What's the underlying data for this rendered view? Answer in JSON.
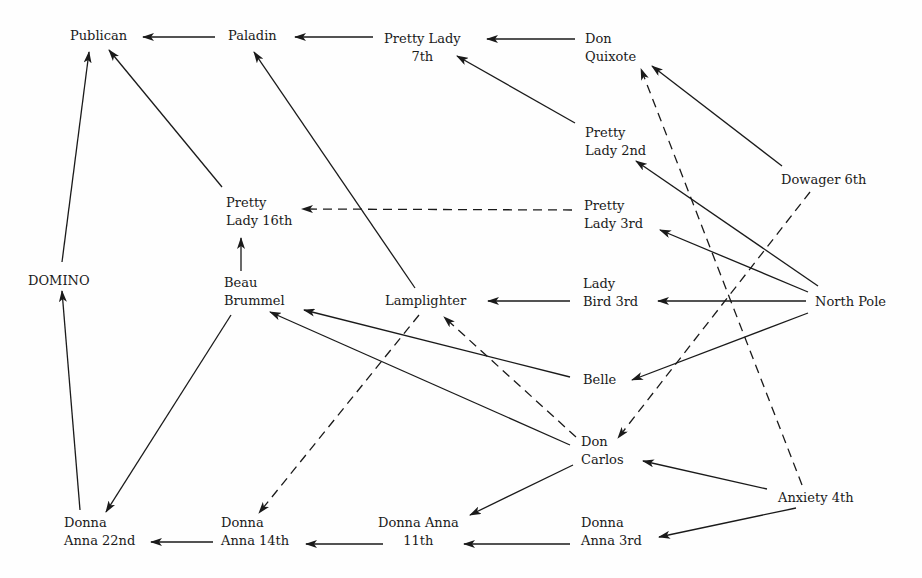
{
  "diagram": {
    "title": "",
    "nodes": [
      {
        "id": "publican",
        "label": "Publican",
        "x": 70,
        "y": 27,
        "align": "left"
      },
      {
        "id": "paladin",
        "label": "Paladin",
        "x": 228,
        "y": 27,
        "align": "left"
      },
      {
        "id": "pretty_lady_7th",
        "label": "Pretty Lady\n7th",
        "x": 384,
        "y": 30,
        "align": "center"
      },
      {
        "id": "don_quixote",
        "label": "Don\nQuixote",
        "x": 585,
        "y": 30,
        "align": "left"
      },
      {
        "id": "pretty_lady_2nd",
        "label": "Pretty\nLady 2nd",
        "x": 585,
        "y": 124,
        "align": "left"
      },
      {
        "id": "dowager_6th",
        "label": "Dowager 6th",
        "x": 781,
        "y": 171,
        "align": "left"
      },
      {
        "id": "pretty_lady_16th",
        "label": "Pretty\nLady 16th",
        "x": 226,
        "y": 194,
        "align": "left"
      },
      {
        "id": "pretty_lady_3rd",
        "label": "Pretty\nLady 3rd",
        "x": 584,
        "y": 197,
        "align": "left"
      },
      {
        "id": "domino",
        "label": "DOMINO",
        "x": 28,
        "y": 272,
        "align": "left"
      },
      {
        "id": "beau_brummel",
        "label": "Beau\nBrummel",
        "x": 224,
        "y": 274,
        "align": "left"
      },
      {
        "id": "lamplighter",
        "label": "Lamplighter",
        "x": 385,
        "y": 292,
        "align": "left"
      },
      {
        "id": "lady_bird_3rd",
        "label": "Lady\nBird 3rd",
        "x": 583,
        "y": 275,
        "align": "left"
      },
      {
        "id": "north_pole",
        "label": "North Pole",
        "x": 815,
        "y": 293,
        "align": "left"
      },
      {
        "id": "belle",
        "label": "Belle",
        "x": 583,
        "y": 371,
        "align": "left"
      },
      {
        "id": "don_carlos",
        "label": "Don\nCarlos",
        "x": 581,
        "y": 433,
        "align": "left"
      },
      {
        "id": "anxiety_4th",
        "label": "Anxiety 4th",
        "x": 778,
        "y": 489,
        "align": "left"
      },
      {
        "id": "donna_anna_22nd",
        "label": "Donna\nAnna 22nd",
        "x": 64,
        "y": 514,
        "align": "left"
      },
      {
        "id": "donna_anna_14th",
        "label": "Donna\nAnna 14th",
        "x": 221,
        "y": 514,
        "align": "left"
      },
      {
        "id": "donna_anna_11th",
        "label": "Donna Anna\n11th",
        "x": 378,
        "y": 514,
        "align": "center"
      },
      {
        "id": "donna_anna_3rd",
        "label": "Donna\nAnna 3rd",
        "x": 581,
        "y": 514,
        "align": "left"
      }
    ],
    "edges": [
      {
        "from": "paladin",
        "to": "publican",
        "style": "solid",
        "x1": 215,
        "y1": 37,
        "x2": 143,
        "y2": 37
      },
      {
        "from": "pretty_lady_7th",
        "to": "paladin",
        "style": "solid",
        "x1": 373,
        "y1": 37,
        "x2": 295,
        "y2": 37
      },
      {
        "from": "don_quixote",
        "to": "pretty_lady_7th",
        "style": "solid",
        "x1": 575,
        "y1": 39,
        "x2": 487,
        "y2": 39
      },
      {
        "from": "pretty_lady_2nd",
        "to": "pretty_lady_7th",
        "style": "solid",
        "x1": 575,
        "y1": 123,
        "x2": 457,
        "y2": 56
      },
      {
        "from": "dowager_6th",
        "to": "don_quixote",
        "style": "solid",
        "x1": 782,
        "y1": 166,
        "x2": 652,
        "y2": 66
      },
      {
        "from": "domino",
        "to": "publican",
        "style": "solid",
        "x1": 62,
        "y1": 262,
        "x2": 89,
        "y2": 52
      },
      {
        "from": "pretty_lady_16th",
        "to": "publican",
        "style": "solid",
        "x1": 222,
        "y1": 187,
        "x2": 109,
        "y2": 50
      },
      {
        "from": "lamplighter",
        "to": "paladin",
        "style": "solid",
        "x1": 415,
        "y1": 288,
        "x2": 254,
        "y2": 52
      },
      {
        "from": "beau_brummel",
        "to": "pretty_lady_16th",
        "style": "solid",
        "x1": 241,
        "y1": 271,
        "x2": 241,
        "y2": 238
      },
      {
        "from": "pretty_lady_3rd",
        "to": "pretty_lady_16th",
        "style": "dashed",
        "x1": 572,
        "y1": 210,
        "x2": 302,
        "y2": 209
      },
      {
        "from": "north_pole",
        "to": "pretty_lady_2nd",
        "style": "solid",
        "x1": 818,
        "y1": 286,
        "x2": 636,
        "y2": 161
      },
      {
        "from": "north_pole",
        "to": "pretty_lady_3rd",
        "style": "solid",
        "x1": 808,
        "y1": 292,
        "x2": 660,
        "y2": 230
      },
      {
        "from": "north_pole",
        "to": "lady_bird_3rd",
        "style": "solid",
        "x1": 806,
        "y1": 301,
        "x2": 658,
        "y2": 301
      },
      {
        "from": "north_pole",
        "to": "belle",
        "style": "solid",
        "x1": 808,
        "y1": 313,
        "x2": 632,
        "y2": 380
      },
      {
        "from": "lady_bird_3rd",
        "to": "lamplighter",
        "style": "solid",
        "x1": 570,
        "y1": 301,
        "x2": 488,
        "y2": 301
      },
      {
        "from": "belle",
        "to": "beau_brummel",
        "style": "solid",
        "x1": 570,
        "y1": 377,
        "x2": 304,
        "y2": 310
      },
      {
        "from": "don_carlos",
        "to": "beau_brummel",
        "style": "solid",
        "x1": 570,
        "y1": 445,
        "x2": 270,
        "y2": 312
      },
      {
        "from": "don_carlos",
        "to": "lamplighter",
        "style": "dashed",
        "x1": 576,
        "y1": 437,
        "x2": 444,
        "y2": 317
      },
      {
        "from": "dowager_6th",
        "to": "don_carlos",
        "style": "dashed",
        "x1": 810,
        "y1": 192,
        "x2": 618,
        "y2": 438
      },
      {
        "from": "anxiety_4th",
        "to": "don_quixote",
        "style": "dashed",
        "x1": 802,
        "y1": 485,
        "x2": 641,
        "y2": 69
      },
      {
        "from": "anxiety_4th",
        "to": "don_carlos",
        "style": "solid",
        "x1": 767,
        "y1": 489,
        "x2": 643,
        "y2": 461
      },
      {
        "from": "anxiety_4th",
        "to": "donna_anna_3rd",
        "style": "solid",
        "x1": 796,
        "y1": 508,
        "x2": 659,
        "y2": 537
      },
      {
        "from": "don_carlos",
        "to": "donna_anna_11th",
        "style": "solid",
        "x1": 573,
        "y1": 465,
        "x2": 470,
        "y2": 515
      },
      {
        "from": "lamplighter",
        "to": "donna_anna_14th",
        "style": "dashed",
        "x1": 419,
        "y1": 315,
        "x2": 259,
        "y2": 513
      },
      {
        "from": "beau_brummel",
        "to": "donna_anna_22nd",
        "style": "solid",
        "x1": 231,
        "y1": 315,
        "x2": 106,
        "y2": 512
      },
      {
        "from": "donna_anna_22nd",
        "to": "domino",
        "style": "solid",
        "x1": 80,
        "y1": 510,
        "x2": 62,
        "y2": 291
      },
      {
        "from": "donna_anna_3rd",
        "to": "donna_anna_11th",
        "style": "solid",
        "x1": 570,
        "y1": 544,
        "x2": 464,
        "y2": 544
      },
      {
        "from": "donna_anna_11th",
        "to": "donna_anna_14th",
        "style": "solid",
        "x1": 383,
        "y1": 544,
        "x2": 306,
        "y2": 544
      },
      {
        "from": "donna_anna_14th",
        "to": "donna_anna_22nd",
        "style": "solid",
        "x1": 213,
        "y1": 542,
        "x2": 151,
        "y2": 542
      }
    ],
    "colors": {
      "ink": "#1a1a1a",
      "background": "#fefefe"
    }
  }
}
